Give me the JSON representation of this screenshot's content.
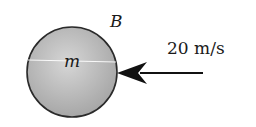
{
  "diagram": {
    "body_label": "B",
    "mass_label": "m",
    "velocity_label": "20 m/s",
    "colors": {
      "sphere_fill_light": "#d2d2d2",
      "sphere_fill_dark": "#9a9a9a",
      "outline": "#2a2a2a",
      "arrow": "#111111",
      "highlight": "#ffffff"
    }
  }
}
